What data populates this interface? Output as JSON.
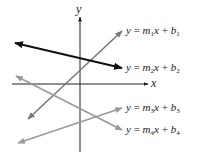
{
  "diagram": {
    "axes": {
      "x_label": "x",
      "y_label": "y",
      "color": "#222222"
    },
    "lines": [
      {
        "id": "line-1",
        "slope_name": "m",
        "subscript": "1",
        "intercept_name": "b",
        "x1": 28,
        "y1": 119,
        "x2": 122,
        "y2": 31,
        "color": "#777777",
        "label_top": 26
      },
      {
        "id": "line-2",
        "slope_name": "m",
        "subscript": "2",
        "intercept_name": "b",
        "x1": 15,
        "y1": 43,
        "x2": 122,
        "y2": 68,
        "color": "#111111",
        "label_top": 63
      },
      {
        "id": "line-3",
        "slope_name": "m",
        "subscript": "3",
        "intercept_name": "b",
        "x1": 18,
        "y1": 143,
        "x2": 122,
        "y2": 108,
        "color": "#999999",
        "label_top": 103
      },
      {
        "id": "line-4",
        "slope_name": "m",
        "subscript": "4",
        "intercept_name": "b",
        "x1": 16,
        "y1": 76,
        "x2": 122,
        "y2": 130,
        "color": "#999999",
        "label_top": 125
      }
    ],
    "labels": [
      {
        "y": "y",
        "eq": "=",
        "m": "m",
        "sub": "1",
        "x": "x",
        "plus": "+",
        "b": "b",
        "bsub": "1"
      },
      {
        "y": "y",
        "eq": "=",
        "m": "m",
        "sub": "2",
        "x": "x",
        "plus": "+",
        "b": "b",
        "bsub": "2"
      },
      {
        "y": "y",
        "eq": "=",
        "m": "m",
        "sub": "3",
        "x": "x",
        "plus": "+",
        "b": "b",
        "bsub": "3"
      },
      {
        "y": "y",
        "eq": "=",
        "m": "m",
        "sub": "4",
        "x": "x",
        "plus": "+",
        "b": "b",
        "bsub": "4"
      }
    ]
  }
}
